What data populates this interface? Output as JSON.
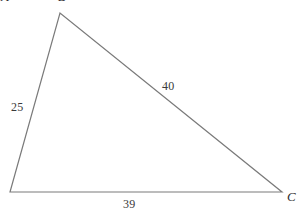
{
  "figure": {
    "kind": "triangle-diagram",
    "background_color": "#ffffff",
    "stroke_color": "#7a7a7a",
    "text_color": "#3a3a3a"
  },
  "side_labels": {
    "left": "25",
    "hypotenuse": "40",
    "base": "39"
  },
  "vertex_labels": {
    "right": "C",
    "left_clipped": "A",
    "apex_clipped": "B"
  },
  "chart_data": {
    "type": "diagram",
    "title": "",
    "shape": "triangle",
    "vertices": [
      {
        "name": "A",
        "x": 10,
        "y": 192
      },
      {
        "name": "B",
        "x": 60,
        "y": 13
      },
      {
        "name": "C",
        "x": 282,
        "y": 192
      }
    ],
    "sides": [
      {
        "from": "A",
        "to": "B",
        "length": 25
      },
      {
        "from": "B",
        "to": "C",
        "length": 40
      },
      {
        "from": "A",
        "to": "C",
        "length": 39
      }
    ],
    "labels": [
      "25",
      "40",
      "39",
      "C"
    ]
  }
}
